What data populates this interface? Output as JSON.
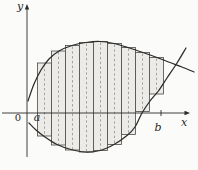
{
  "figure": {
    "title_semantic": "region between two curves approximated by Riemann rectangles",
    "colors": {
      "background": "#fbfbf9",
      "curve": "#2b2b2b",
      "axis": "#2b2b2b",
      "rect_edge": "#4a4a4a",
      "rect_fill": "#ecebe7",
      "dash": "#8f8f8f",
      "label": "#2a2a2a"
    },
    "labels": {
      "y_axis": "y",
      "x_axis": "x",
      "origin": "0",
      "a": "a",
      "b": "b"
    },
    "label_pos": {
      "y_axis": {
        "x": 20,
        "y": 6
      },
      "x_axis": {
        "x": 184,
        "y": 122
      },
      "origin": {
        "x": 18,
        "y": 118
      },
      "a": {
        "x": 37,
        "y": 117
      },
      "b": {
        "x": 158,
        "y": 127
      }
    },
    "axes": {
      "x_axis": {
        "y": 113,
        "x1": 2,
        "x2": 186,
        "arrow_tip_x": 190
      },
      "y_axis": {
        "x": 27,
        "y1": 157,
        "y2": 9,
        "arrow_tip_y": 4
      },
      "b_tick": {
        "x": 161,
        "y1": 110,
        "y2": 116
      }
    },
    "rects": {
      "x_left": [
        37.5,
        51.5,
        65.5,
        79.5,
        93.5,
        107.5,
        121.5,
        135.5,
        149.5
      ],
      "width": 14,
      "tops": [
        63,
        51,
        45.5,
        42.5,
        41.5,
        43.5,
        47.5,
        52.5,
        57.5
      ],
      "bottoms": [
        136,
        145,
        150,
        152,
        150.5,
        144.5,
        134.5,
        111.5,
        94
      ]
    },
    "curves": {
      "upper": [
        [
          28,
          101
        ],
        [
          34,
          84
        ],
        [
          41,
          70
        ],
        [
          49,
          59
        ],
        [
          59,
          51
        ],
        [
          72,
          45.5
        ],
        [
          86,
          42.5
        ],
        [
          100,
          41.5
        ],
        [
          114,
          43.5
        ],
        [
          128,
          47.5
        ],
        [
          143,
          52.5
        ],
        [
          157,
          57.5
        ],
        [
          170,
          62.5
        ],
        [
          182,
          67
        ],
        [
          194,
          72
        ]
      ],
      "lower": [
        [
          29,
          123
        ],
        [
          36,
          130
        ],
        [
          45,
          137
        ],
        [
          57,
          144.5
        ],
        [
          71,
          149.5
        ],
        [
          85,
          152
        ],
        [
          100,
          150.5
        ],
        [
          114,
          144.5
        ],
        [
          127,
          135.5
        ],
        [
          135,
          127
        ],
        [
          142,
          113
        ],
        [
          150,
          101
        ],
        [
          158,
          91.5
        ],
        [
          167,
          78
        ],
        [
          177,
          63
        ],
        [
          186,
          48
        ]
      ]
    }
  }
}
